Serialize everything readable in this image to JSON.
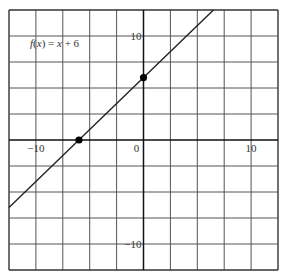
{
  "chart_data": {
    "type": "line",
    "title": "",
    "annotation": "f(x) = x + 6",
    "annotation_parts": {
      "f": "f",
      "open": "(",
      "x": "x",
      "close": ")",
      "rest": " = ",
      "x2": "x",
      "tail": " + 6"
    },
    "function": "f(x) = x + 6",
    "slope": 1,
    "intercept": 6,
    "xlabel": "",
    "ylabel": "",
    "xlim": [
      -12.5,
      12.5
    ],
    "ylim": [
      -12.5,
      12.5
    ],
    "grid": true,
    "grid_step": 2.5,
    "x_tick_labels": [
      {
        "value": -10,
        "label": "−10"
      },
      {
        "value": 10,
        "label": "10"
      }
    ],
    "y_tick_labels": [
      {
        "value": 10,
        "label": "10"
      },
      {
        "value": -10,
        "label": "−10"
      }
    ],
    "origin_label": "0",
    "series": [
      {
        "name": "f(x) = x + 6",
        "x": [
          -12.5,
          6.5
        ],
        "y": [
          -6.5,
          12.5
        ]
      }
    ],
    "highlighted_points": [
      {
        "name": "x-intercept",
        "x": -6,
        "y": 0
      },
      {
        "name": "y-intercept",
        "x": 0,
        "y": 6
      }
    ],
    "colors": {
      "line": "#222222",
      "grid": "#555555",
      "axis": "#111111",
      "point": "#000000"
    }
  }
}
